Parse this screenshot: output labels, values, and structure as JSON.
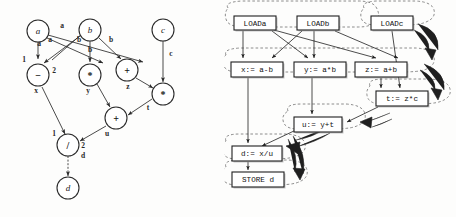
{
  "figure": {
    "panels": [
      "dependence-graph",
      "schedule-graph"
    ]
  },
  "left_graph": {
    "title": "",
    "nodes": [
      {
        "id": "a",
        "label": "a",
        "type": "operand",
        "x": 38,
        "y": 31,
        "r": 11
      },
      {
        "id": "b",
        "label": "b",
        "type": "operand",
        "x": 90,
        "y": 30,
        "r": 11
      },
      {
        "id": "c",
        "label": "c",
        "type": "operand",
        "x": 163,
        "y": 30,
        "r": 11
      },
      {
        "id": "sub",
        "label": "−",
        "type": "operator",
        "x": 38,
        "y": 75,
        "r": 11
      },
      {
        "id": "mul1",
        "label": "*",
        "type": "operator",
        "x": 90,
        "y": 75,
        "r": 11
      },
      {
        "id": "add1",
        "label": "+",
        "type": "operator",
        "x": 127,
        "y": 70,
        "r": 11
      },
      {
        "id": "mul2",
        "label": "*",
        "type": "operator",
        "x": 163,
        "y": 94,
        "r": 11
      },
      {
        "id": "add2",
        "label": "+",
        "type": "operator",
        "x": 116,
        "y": 118,
        "r": 11
      },
      {
        "id": "div",
        "label": "/",
        "type": "operator",
        "x": 68,
        "y": 145,
        "r": 11
      },
      {
        "id": "d",
        "label": "d",
        "type": "operand",
        "x": 68,
        "y": 188,
        "r": 11
      }
    ],
    "node_names": [
      {
        "node": "sub",
        "name": "x",
        "x": 36,
        "y": 93
      },
      {
        "node": "mul1",
        "name": "y",
        "x": 88,
        "y": 93
      },
      {
        "node": "add1",
        "name": "z",
        "x": 128,
        "y": 89
      },
      {
        "node": "mul2",
        "name": "t",
        "x": 148,
        "y": 110
      },
      {
        "node": "add2",
        "name": "u",
        "x": 107,
        "y": 136
      },
      {
        "node": "div",
        "name": "d",
        "x": 83,
        "y": 158
      }
    ],
    "edges": [
      {
        "from": "a",
        "to": "sub",
        "label": "a",
        "port": "1"
      },
      {
        "from": "a",
        "to": "mul1",
        "label": "a",
        "port": ""
      },
      {
        "from": "a",
        "to": "add1",
        "label": "a",
        "port": ""
      },
      {
        "from": "b",
        "to": "sub",
        "label": "b",
        "port": "2"
      },
      {
        "from": "b",
        "to": "mul1",
        "label": "b",
        "port": ""
      },
      {
        "from": "b",
        "to": "add1",
        "label": "b",
        "port": ""
      },
      {
        "from": "c",
        "to": "mul2",
        "label": "c",
        "port": ""
      },
      {
        "from": "add1",
        "to": "mul2",
        "label": "z",
        "port": ""
      },
      {
        "from": "mul1",
        "to": "add2",
        "label": "y",
        "port": ""
      },
      {
        "from": "mul2",
        "to": "add2",
        "label": "t",
        "port": ""
      },
      {
        "from": "sub",
        "to": "div",
        "label": "x",
        "port": "1"
      },
      {
        "from": "add2",
        "to": "div",
        "label": "u",
        "port": "2"
      },
      {
        "from": "div",
        "to": "d",
        "label": "d",
        "port": "",
        "style": "dashed"
      }
    ],
    "port_labels": [
      {
        "text": "1",
        "x": 24,
        "y": 62
      },
      {
        "text": "2",
        "x": 54,
        "y": 73
      },
      {
        "text": "1",
        "x": 54,
        "y": 136
      },
      {
        "text": "2",
        "x": 83,
        "y": 148
      }
    ],
    "edge_labels": [
      {
        "text": "a",
        "x": 62,
        "y": 28
      },
      {
        "text": "a",
        "x": 50,
        "y": 42
      },
      {
        "text": "a",
        "x": 39,
        "y": 46
      },
      {
        "text": "b",
        "x": 79,
        "y": 42
      },
      {
        "text": "b",
        "x": 90,
        "y": 52
      },
      {
        "text": "b",
        "x": 111,
        "y": 42
      },
      {
        "text": "c",
        "x": 171,
        "y": 56
      }
    ]
  },
  "right_graph": {
    "boxes": [
      {
        "id": "loada",
        "label": "LOADa",
        "x": 234,
        "y": 16,
        "w": 42,
        "h": 14
      },
      {
        "id": "loadb",
        "label": "LOADb",
        "x": 297,
        "y": 16,
        "w": 42,
        "h": 14
      },
      {
        "id": "loadc",
        "label": "LOADc",
        "x": 371,
        "y": 16,
        "w": 42,
        "h": 14
      },
      {
        "id": "xbox",
        "label": "x:= a-b",
        "x": 231,
        "y": 62,
        "w": 52,
        "h": 15
      },
      {
        "id": "ybox",
        "label": "y:= a*b",
        "x": 294,
        "y": 62,
        "w": 52,
        "h": 15
      },
      {
        "id": "zbox",
        "label": "z:= a+b",
        "x": 355,
        "y": 62,
        "w": 52,
        "h": 15
      },
      {
        "id": "tbox",
        "label": "t:= z*c",
        "x": 376,
        "y": 91,
        "w": 52,
        "h": 15
      },
      {
        "id": "ubox",
        "label": "u:= y+t",
        "x": 294,
        "y": 117,
        "w": 48,
        "h": 15
      },
      {
        "id": "dbox",
        "label": "d:= x/u",
        "x": 232,
        "y": 146,
        "w": 50,
        "h": 15
      },
      {
        "id": "storebox",
        "label": "STORE d",
        "x": 232,
        "y": 172,
        "w": 52,
        "h": 15
      }
    ],
    "edges": [
      {
        "from": "loada",
        "to": "xbox"
      },
      {
        "from": "loada",
        "to": "ybox"
      },
      {
        "from": "loada",
        "to": "zbox"
      },
      {
        "from": "loadb",
        "to": "xbox"
      },
      {
        "from": "loadb",
        "to": "ybox"
      },
      {
        "from": "loadb",
        "to": "zbox"
      },
      {
        "from": "loadc",
        "to": "tbox"
      },
      {
        "from": "zbox",
        "to": "tbox"
      },
      {
        "from": "xbox",
        "to": "dbox"
      },
      {
        "from": "ybox",
        "to": "ubox"
      },
      {
        "from": "tbox",
        "to": "ubox"
      },
      {
        "from": "ubox",
        "to": "dbox"
      },
      {
        "from": "dbox",
        "to": "storebox"
      }
    ],
    "cluster_count": 7,
    "thick_arrow_count": 5
  }
}
